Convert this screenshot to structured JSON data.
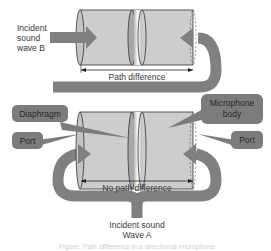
{
  "diagram": {
    "type": "microphone-path-difference",
    "colors": {
      "arrow": "#808080",
      "body_fill": "#cdcdcd",
      "body_stroke": "#333333",
      "callout_fill": "#7c7c7c",
      "callout_text": "#2a2a2a",
      "text": "#3a3a3a"
    },
    "top": {
      "incident_label_line1": "Incident",
      "incident_label_line2": "sound",
      "incident_label_line3": "wave B",
      "measure_label": "Path difference"
    },
    "bottom": {
      "callout_diaphragm": "Diaphragm",
      "callout_body_line1": "Microphone",
      "callout_body_line2": "body",
      "callout_port_left": "Port",
      "callout_port_right": "Port",
      "measure_label": "No path difference",
      "incident_label_line1": "Incident sound",
      "incident_label_line2": "Wave A"
    },
    "caption": "Figure: Path difference in a directional microphone"
  }
}
